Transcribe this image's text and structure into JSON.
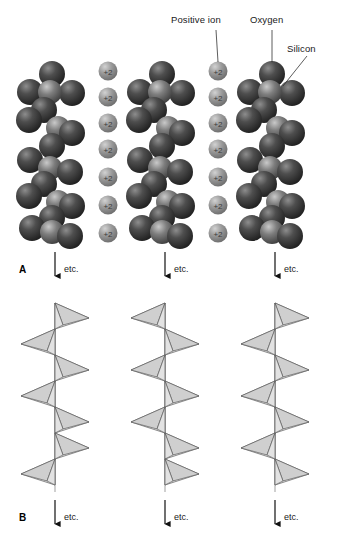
{
  "figure": {
    "panels": [
      {
        "letter": "A",
        "description": "space-filling sphere model"
      },
      {
        "letter": "B",
        "description": "tetrahedra model"
      }
    ],
    "callouts": [
      {
        "id": "positive-ion",
        "label": "Positive ion"
      },
      {
        "id": "oxygen",
        "label": "Oxygen"
      },
      {
        "id": "silicon",
        "label": "Silicon"
      }
    ],
    "ion_charge_label": "+2",
    "continuation_label": "etc.",
    "chains": 3,
    "ions_per_column": 7,
    "ion_columns": 2,
    "tetrahedra_per_chain": 10,
    "colors": {
      "oxygen": "#3a3a3a",
      "silicon": "#6e6e6e",
      "positive_ion": "#8c8c8c",
      "tetra_light": "#f2f2f2",
      "tetra_shade": "#c9c9c9",
      "tetra_edge": "#555555",
      "axis": "#9a9a9a",
      "text": "#1a1a1a",
      "background": "#ffffff"
    }
  }
}
